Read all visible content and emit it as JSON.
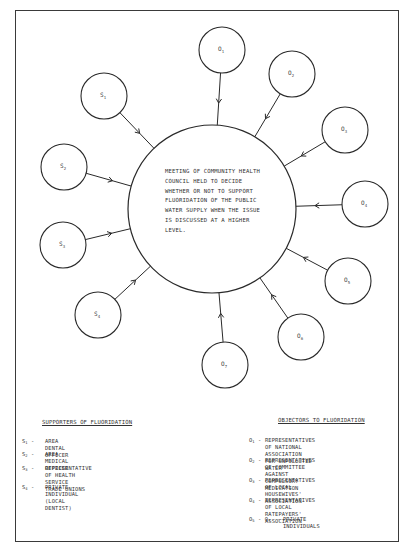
{
  "diagram": {
    "central_node": {
      "text": "MEETING OF COMMUNITY HEALTH\nCOUNCIL HELD TO DECIDE\nWHETHER OR NOT TO SUPPORT\nFLUORIDATION OF THE PUBLIC\nWATER SUPPLY WHEN THE ISSUE\nIS DISCUSSED AT A HIGHER\nLEVEL.",
      "cx": 212,
      "cy": 209,
      "r": 84
    },
    "nodes": [
      {
        "id": "S1",
        "letter": "S",
        "sub": "1",
        "group": "supporter",
        "cx": 104,
        "cy": 96
      },
      {
        "id": "S2",
        "letter": "S",
        "sub": "2",
        "group": "supporter",
        "cx": 64,
        "cy": 167
      },
      {
        "id": "S3",
        "letter": "S",
        "sub": "3",
        "group": "supporter",
        "cx": 63,
        "cy": 245
      },
      {
        "id": "S4",
        "letter": "S",
        "sub": "4",
        "group": "supporter",
        "cx": 98,
        "cy": 315
      },
      {
        "id": "O1",
        "letter": "O",
        "sub": "1",
        "group": "objector",
        "cx": 222,
        "cy": 50
      },
      {
        "id": "O2",
        "letter": "O",
        "sub": "2",
        "group": "objector",
        "cx": 292,
        "cy": 74
      },
      {
        "id": "O3",
        "letter": "O",
        "sub": "3",
        "group": "objector",
        "cx": 345,
        "cy": 130
      },
      {
        "id": "O4",
        "letter": "O",
        "sub": "4",
        "group": "objector",
        "cx": 365,
        "cy": 204
      },
      {
        "id": "O5",
        "letter": "O",
        "sub": "5",
        "group": "objector",
        "cx": 348,
        "cy": 281
      },
      {
        "id": "O6",
        "letter": "O",
        "sub": "6",
        "group": "objector",
        "cx": 301,
        "cy": 337
      },
      {
        "id": "O7",
        "letter": "O",
        "sub": "7",
        "group": "objector",
        "cx": 225,
        "cy": 365
      }
    ],
    "node_radius": 23,
    "edges_direction": "all arrows point from outer node into central meeting node"
  },
  "legend": {
    "supporters": {
      "title": "SUPPORTERS OF FLUORIDATION",
      "items": [
        {
          "letter": "S",
          "sub": "1",
          "desc": "AREA DENTAL OFFICER"
        },
        {
          "letter": "S",
          "sub": "2",
          "desc": "AREA MEDICAL OFFICER"
        },
        {
          "letter": "S",
          "sub": "3",
          "desc": "REPRESENTATIVE OF HEALTH SERVICE\nTRADE UNIONS"
        },
        {
          "letter": "S",
          "sub": "4",
          "desc": "PRIVATE INDIVIDUAL (LOCAL DENTIST)"
        }
      ]
    },
    "objectors": {
      "title": "OBJECTORS TO FLUORIDATION",
      "items": [
        {
          "letter": "O",
          "sub": "1",
          "desc": "REPRESENTATIVES OF NATIONAL ASSOCIATION\nFOR UNPOLLUTED WATER"
        },
        {
          "letter": "O",
          "sub": "2",
          "desc": "REPRESENTATIVES OF COMMITTEE AGAINST\nCOMPULSORY MEDICATION"
        },
        {
          "letter": "O",
          "sub": "3",
          "desc": "REPRESENTATIVES OF LOCAL HOUSEWIVES'\nASSOCIATION"
        },
        {
          "letter": "O",
          "sub": "4",
          "desc": "REPRESENTATIVES OF LOCAL RATEPAYERS'\nASSOCIATION"
        },
        {
          "letter": "O",
          "sub": "5 - O7",
          "desc": "PRIVATE INDIVIDUALS",
          "range_label": "O5 - O7"
        }
      ]
    }
  },
  "dash": " - "
}
